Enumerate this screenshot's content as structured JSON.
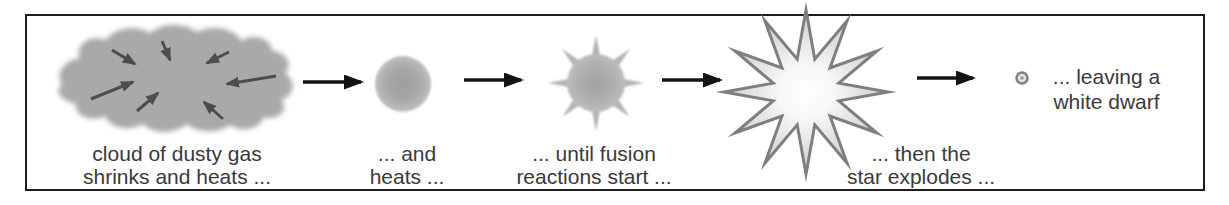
{
  "diagram": {
    "stages": [
      {
        "name": "gas-cloud",
        "label_line1": "cloud of dusty gas",
        "label_line2": "shrinks and heats ..."
      },
      {
        "name": "protostar",
        "label_line1": "... and",
        "label_line2": "heats ..."
      },
      {
        "name": "fusion-star",
        "label_line1": "... until fusion",
        "label_line2": "reactions start ..."
      },
      {
        "name": "supernova",
        "label_line1": "... then the",
        "label_line2": "star explodes ..."
      },
      {
        "name": "white-dwarf",
        "label_line1": "... leaving a",
        "label_line2": "white dwarf"
      }
    ],
    "icons": [
      "gas-cloud-icon",
      "inward-arrow-icon",
      "flow-arrow-icon",
      "protostar-icon",
      "fusion-star-icon",
      "supernova-icon",
      "white-dwarf-icon"
    ],
    "colors": {
      "frame_border": "#1d1d1d",
      "background": "#ffffff",
      "cloud_fill": "#a9a9a9",
      "inward_arrow": "#4d4d4d",
      "flow_arrow": "#141414",
      "protostar_fill": "#a9a9a9",
      "fusion_star_fill": "#b1b1b1",
      "supernova_fill_center": "#ffffff",
      "supernova_fill_edge": "#c8c8c8",
      "supernova_stroke": "#7f7f7f",
      "white_dwarf_stroke": "#828282",
      "white_dwarf_fill": "#e3e3e3",
      "text": "#3a3a3a"
    }
  }
}
